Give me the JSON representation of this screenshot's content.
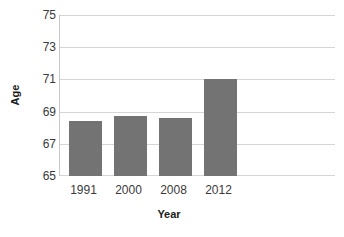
{
  "chart_data": {
    "type": "bar",
    "title": "",
    "subtitle": "",
    "xlabel": "Year",
    "ylabel": "Age",
    "categories": [
      "1991",
      "2000",
      "2008",
      "2012"
    ],
    "values": [
      68.4,
      68.7,
      68.6,
      71.0
    ],
    "series": [
      {
        "name": "Age",
        "values": [
          68.4,
          68.7,
          68.6,
          71.0
        ]
      }
    ],
    "ylim": [
      65,
      75
    ],
    "xlim": null,
    "ytick_labels": [
      "75",
      "73",
      "71",
      "69",
      "67",
      "65"
    ],
    "ytick_values": [
      75,
      73,
      71,
      69,
      67,
      65
    ],
    "xtick_labels": [
      "1991",
      "2000",
      "2008",
      "2012"
    ],
    "grid": "horizontal",
    "legend": "none",
    "annotations": [],
    "colors": {
      "bar_fill": "#737373",
      "gridline": "#d5d5d5",
      "axis_line": "#c9c9c9",
      "background": "#ffffff",
      "tick_text": "#3a3a3a",
      "title_text": "#1a1a1a"
    }
  }
}
